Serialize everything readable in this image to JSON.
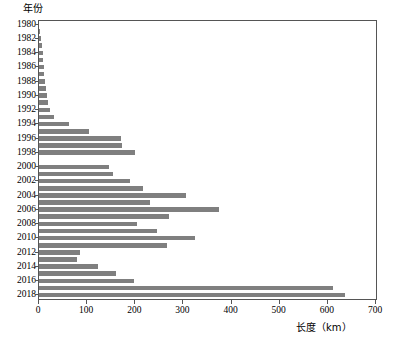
{
  "chart_data": {
    "type": "bar",
    "orientation": "horizontal",
    "title": "",
    "xlabel": "长度（km）",
    "ylabel": "年份",
    "xlim": [
      0,
      700
    ],
    "xticks": [
      0,
      100,
      200,
      300,
      400,
      500,
      600,
      700
    ],
    "ytick_labels": [
      "1980",
      "1982",
      "1984",
      "1986",
      "1988",
      "1990",
      "1992",
      "1994",
      "1996",
      "1998",
      "2000",
      "2002",
      "2004",
      "2006",
      "2008",
      "2010",
      "2012",
      "2014",
      "2016",
      "2018"
    ],
    "grid": false,
    "legend": null,
    "bar_color": "#7f7f7f",
    "categories": [
      "1980",
      "1981",
      "1982",
      "1983",
      "1984",
      "1985",
      "1986",
      "1987",
      "1988",
      "1989",
      "1990",
      "1991",
      "1992",
      "1993",
      "1994",
      "1995",
      "1996",
      "1997",
      "1998",
      "1999",
      "2000",
      "2001",
      "2002",
      "2003",
      "2004",
      "2005",
      "2006",
      "2007",
      "2008",
      "2009",
      "2010",
      "2011",
      "2012",
      "2013",
      "2014",
      "2015",
      "2016",
      "2017",
      "2018"
    ],
    "values": [
      0,
      3,
      5,
      6,
      8,
      8,
      10,
      10,
      12,
      14,
      16,
      18,
      22,
      32,
      62,
      104,
      170,
      172,
      200,
      0,
      146,
      154,
      190,
      216,
      305,
      230,
      373,
      270,
      203,
      246,
      325,
      265,
      86,
      78,
      122,
      160,
      197,
      610,
      635
    ],
    "series": [
      {
        "name": "长度",
        "values": [
          0,
          3,
          5,
          6,
          8,
          8,
          10,
          10,
          12,
          14,
          16,
          18,
          22,
          32,
          62,
          104,
          170,
          172,
          200,
          0,
          146,
          154,
          190,
          216,
          305,
          230,
          373,
          270,
          203,
          246,
          325,
          265,
          86,
          78,
          122,
          160,
          197,
          610,
          635
        ]
      }
    ]
  }
}
